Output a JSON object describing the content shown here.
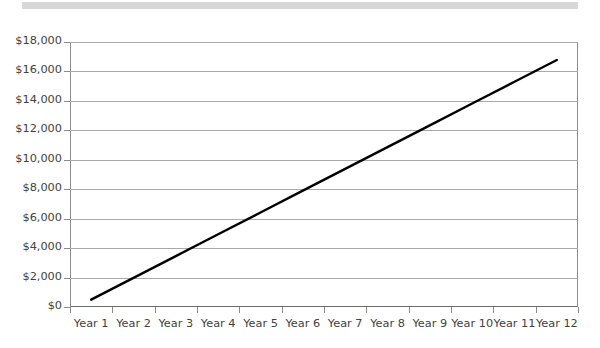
{
  "page": {
    "background_color": "#ffffff",
    "top_bar": {
      "name": "decorative-grey-bar",
      "color": "#d8d8d8"
    }
  },
  "chart_data": {
    "type": "line",
    "title": "",
    "subtitle": "",
    "xlabel": "",
    "ylabel": "",
    "categories": [
      "Year 1",
      "Year 2",
      "Year 3",
      "Year 4",
      "Year 5",
      "Year 6",
      "Year 7",
      "Year 8",
      "Year 9",
      "Year 10",
      "Year 11",
      "Year 12"
    ],
    "series": [
      {
        "name": "Cumulative value",
        "color": "#000000",
        "values": [
          500,
          1980,
          3460,
          4940,
          6420,
          7900,
          9380,
          10860,
          12340,
          13820,
          15300,
          16780
        ]
      }
    ],
    "ylim": [
      0,
      18000
    ],
    "yticks": [
      0,
      2000,
      4000,
      6000,
      8000,
      10000,
      12000,
      14000,
      16000,
      18000
    ],
    "ytick_labels": [
      "$0",
      "$2,000",
      "$4,000",
      "$6,000",
      "$8,000",
      "$10,000",
      "$12,000",
      "$14,000",
      "$16,000",
      "$18,000"
    ],
    "xtick_labels": [
      "Year 1",
      "Year 2",
      "Year 3",
      "Year 4",
      "Year 5",
      "Year 6",
      "Year 7",
      "Year 8",
      "Year 9",
      "Year 10",
      "Year 11",
      "Year 12"
    ],
    "grid": true,
    "grid_color": "#a9a9a9",
    "legend": false,
    "legend_position": "none",
    "markers": false,
    "line_width": 2.4,
    "axis_color": "#8c8c8c",
    "text_color": "#3f3f3f"
  }
}
